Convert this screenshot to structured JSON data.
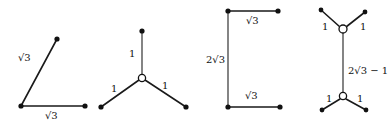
{
  "figures": [
    {
      "id": "angle-two-edges",
      "labels": {
        "left_edge": "√3",
        "bottom_edge": "√3"
      }
    },
    {
      "id": "steiner-three-star",
      "labels": {
        "top_edge": "1",
        "left_edge": "1",
        "right_edge": "1"
      }
    },
    {
      "id": "bracket-three-edges",
      "labels": {
        "top_edge": "√3",
        "vertical_edge": "2√3",
        "bottom_edge": "√3"
      }
    },
    {
      "id": "steiner-double-star",
      "labels": {
        "top_left_edge": "1",
        "top_right_edge": "1",
        "middle_edge": "2√3 − 1",
        "bottom_left_edge": "1",
        "bottom_right_edge": "1"
      }
    }
  ],
  "colors": {
    "stroke": "#1a1a1a",
    "node": "#111111",
    "background": "#ffffff"
  }
}
